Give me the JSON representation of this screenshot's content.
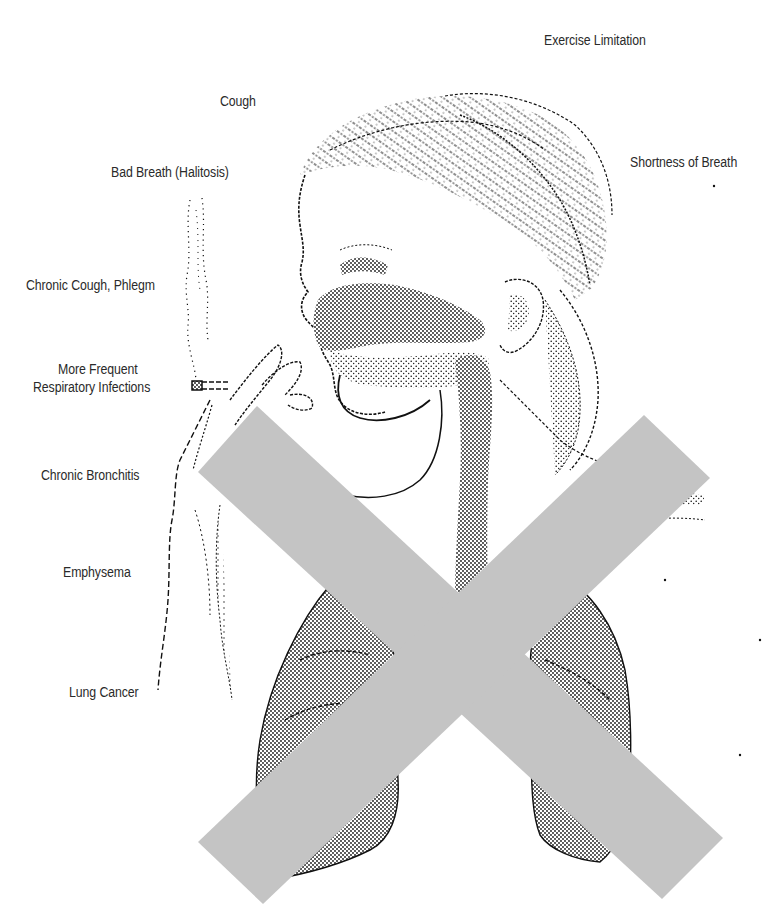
{
  "figure": {
    "overlay": {
      "type": "x-mark",
      "color": "#c4c4c4"
    }
  },
  "labels": {
    "exercise_limitation": "Exercise Limitation",
    "cough": "Cough",
    "shortness_of_breath": "Shortness of Breath",
    "bad_breath": "Bad Breath (Halitosis)",
    "chronic_cough_phlegm": "Chronic Cough, Phlegm",
    "respiratory_infections_line1": "More Frequent",
    "respiratory_infections_line2": "Respiratory Infections",
    "chronic_bronchitis": "Chronic Bronchitis",
    "emphysema": "Emphysema",
    "lung_cancer": "Lung Cancer"
  },
  "colors": {
    "ink": "#111111",
    "label_text": "#2a2a2a",
    "x_mark": "#c4c4c4",
    "background": "#ffffff"
  }
}
